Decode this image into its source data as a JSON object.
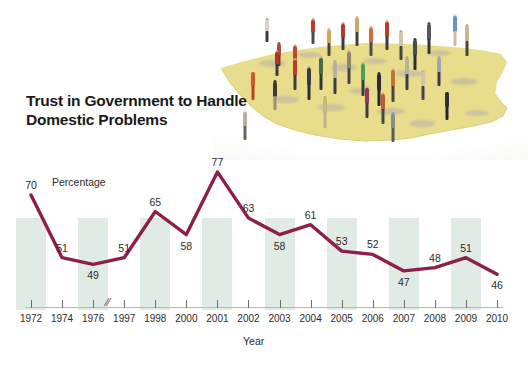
{
  "headline": "Trust in Government to\nHandle Domestic Problems",
  "photo": {
    "caption_alt": "miniature figurines standing on a yellow map of the United States",
    "map_color": "#e8dd8b",
    "figure_count": 34
  },
  "colors": {
    "line": "#8e1f4b",
    "bar": "#d9e8df",
    "title": "#1a1a1a",
    "axis": "#6d6d6d",
    "text": "#2b2b2b",
    "map": "#e8dd8b"
  },
  "chart_data": {
    "type": "line",
    "title": "Trust in Government to Handle Domestic Problems",
    "xlabel": "Year",
    "ylabel": "Percentage",
    "series_label": "Percentage",
    "grid": false,
    "legend": "none",
    "axis_break_after": "1976",
    "ylim": [
      40,
      82
    ],
    "categories": [
      "1972",
      "1974",
      "1976",
      "1997",
      "1998",
      "2000",
      "2001",
      "2002",
      "2003",
      "2004",
      "2005",
      "2006",
      "2007",
      "2008",
      "2009",
      "2010"
    ],
    "values": [
      70,
      51,
      49,
      51,
      65,
      58,
      77,
      63,
      58,
      61,
      53,
      52,
      47,
      48,
      51,
      46
    ],
    "point_labels": [
      "70",
      "51",
      "49",
      "51",
      "65",
      "58",
      "77",
      "63",
      "58",
      "61",
      "53",
      "52",
      "47",
      "48",
      "51",
      "46"
    ],
    "tick_labels": [
      "1972",
      "1974",
      "1976",
      "1997",
      "1998",
      "2000",
      "2001",
      "2002",
      "2003",
      "2004",
      "2005",
      "2006",
      "2007",
      "2008",
      "2009",
      "2010"
    ]
  }
}
